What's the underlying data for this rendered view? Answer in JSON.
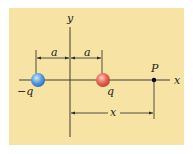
{
  "figure": {
    "panel_color": "#F7E3A3",
    "line_color": "#2a2a2a",
    "axes": {
      "x_label": "x",
      "y_label": "y"
    },
    "charges": [
      {
        "label": "−q",
        "color": "#4A90D9",
        "highlight": "#BFE0FA",
        "position": "-a"
      },
      {
        "label": "q",
        "color": "#E0604A",
        "highlight": "#FBC2B4",
        "position": "+a"
      }
    ],
    "point": {
      "label": "P",
      "color": "#000000"
    },
    "dimensions": {
      "left_a": "a",
      "right_a": "a",
      "distance_x": "x"
    }
  }
}
